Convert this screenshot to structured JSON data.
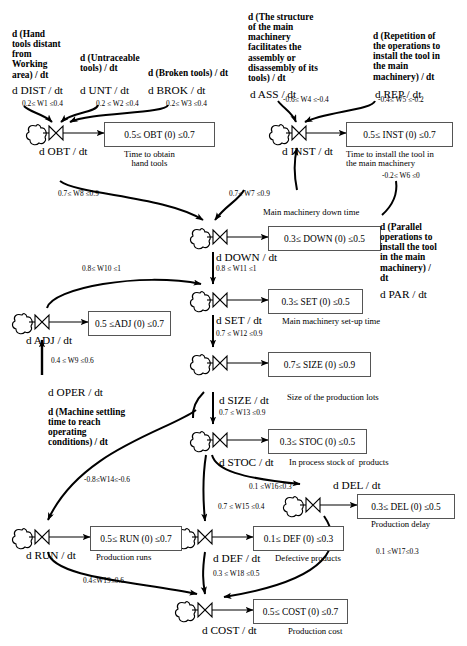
{
  "diagram": {
    "type": "stock-and-flow system dynamics diagram",
    "nodes": [
      {
        "id": "OBT",
        "rate": "d OBT / dt",
        "box": "0.5≤ OBT (0) ≤0.7",
        "caption": "Time to obtain\nhand tools"
      },
      {
        "id": "INST",
        "rate": "d INST / dt",
        "box": "0.5≤ INST (0) ≤0.7",
        "caption": "Time to install the tool in\nthe main machinery"
      },
      {
        "id": "DOWN",
        "rate": "d DOWN / dt",
        "box": "0.3≤ DOWN (0) ≤0.5",
        "caption": "Main machinery down time"
      },
      {
        "id": "SET",
        "rate": "d SET / dt",
        "box": "0.3≤ SET (0) ≤0.5",
        "caption": "Main machinery set-up time"
      },
      {
        "id": "SIZE",
        "rate": "d SIZE / dt",
        "box": "0.7≤ SIZE (0) ≤0.9",
        "caption": "Size of the production lots"
      },
      {
        "id": "STOC",
        "rate": "d STOC / dt",
        "box": "0.3≤ STOC (0) ≤0.5",
        "caption": "In process stock of  products"
      },
      {
        "id": "ADJ",
        "rate": "d ADJ / dt",
        "box": "0.5 ≤ADJ (0) ≤0.7",
        "caption": ""
      },
      {
        "id": "RUN",
        "rate": "d RUN / dt",
        "box": "0.5≤ RUN (0) ≤0.7",
        "caption": "Production runs"
      },
      {
        "id": "DEF",
        "rate": "d DEF / dt",
        "box": "0.1≤ DEF (0) ≤0.3",
        "caption": "Defective products"
      },
      {
        "id": "DEL",
        "rate": "d DEL / dt",
        "box": "0.3≤ DEL (0) ≤0.5",
        "caption": "Production delay"
      },
      {
        "id": "COST",
        "rate": "d COST / dt",
        "box": "0.5≤ COST (0) ≤0.7",
        "caption": "Production cost"
      }
    ],
    "inputs": [
      {
        "id": "DIST",
        "description": "d (Hand\ntools distant\nfrom\nWorking\narea) / dt",
        "rate": "d DIST / dt"
      },
      {
        "id": "UNT",
        "description": "d (Untraceable\ntools) / dt",
        "rate": "d UNT / dt"
      },
      {
        "id": "BROK",
        "description": "d (Broken tools) / dt",
        "rate": "d BROK / dt"
      },
      {
        "id": "ASS",
        "description": "d (The structure\nof the main\nmachinery\nfacilitates the\nassembly or\ndisassembly of its\ntools) / dt",
        "rate": "d ASS / dt"
      },
      {
        "id": "REP",
        "description": "d (Repetition of\nthe operations to\ninstall the tool in\nthe main\nmachinery) / dt",
        "rate": "d REP / dt"
      },
      {
        "id": "PAR",
        "description": "d (Parallel\noperations to\ninstall the tool\nin the main\nmachinery) /\ndt",
        "rate": "d PAR / dt"
      },
      {
        "id": "OPER",
        "description": "d (Machine settling\ntime to reach\noperating\nconditions) / dt",
        "rate": "d OPER / dt"
      }
    ],
    "weights": [
      {
        "id": "W1",
        "label": "0.2≤ W1 ≤0.4"
      },
      {
        "id": "W2",
        "label": "0.2 ≤ W2 ≤0.4"
      },
      {
        "id": "W3",
        "label": "0.2≤ W3 ≤0.4"
      },
      {
        "id": "W4",
        "label": "-0.6≤ W4 ≤-0.4"
      },
      {
        "id": "W5",
        "label": "-0.4≤ W5 ≤-0.2"
      },
      {
        "id": "W6",
        "label": "-0.2≤ W6 ≤0"
      },
      {
        "id": "W7",
        "label": "0.7≤ W7 ≤0.9"
      },
      {
        "id": "W8",
        "label": "0.7≤ W8 ≤0.9"
      },
      {
        "id": "W9",
        "label": "0.4 ≤ W9 ≤0.6"
      },
      {
        "id": "W10",
        "label": "0.8≤ W10 ≤1"
      },
      {
        "id": "W11",
        "label": "0.8 ≤ W11 ≤1"
      },
      {
        "id": "W12",
        "label": "0.7 ≤ W12 ≤0.9"
      },
      {
        "id": "W13",
        "label": "0.7 ≤ W13 ≤0.9"
      },
      {
        "id": "W14",
        "label": "-0.8≤W14≤-0.6"
      },
      {
        "id": "W15",
        "label": "0.7 ≤ W15 ≤0.4"
      },
      {
        "id": "W16",
        "label": "0.1 ≤W16≤0.3"
      },
      {
        "id": "W17",
        "label": "0.1 ≤W17≤0.3"
      },
      {
        "id": "W18",
        "label": "0.3 ≤ W18 ≤0.5"
      },
      {
        "id": "W19",
        "label": "0.4≤W19≤0.6"
      }
    ]
  }
}
